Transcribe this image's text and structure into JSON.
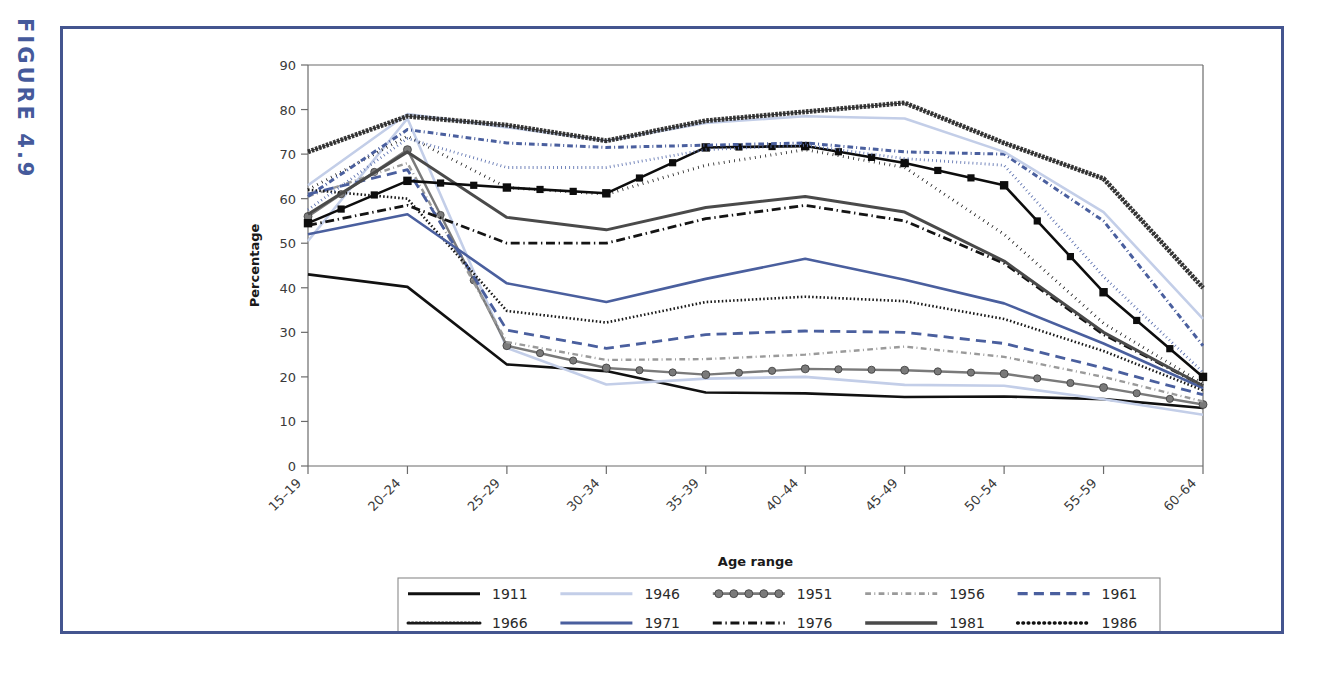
{
  "figure": {
    "label": "FIGURE 4.9",
    "label_color": "#455a9b",
    "frame_color": "#44558f"
  },
  "chart_data": {
    "type": "line",
    "title": "",
    "xlabel": "Age range",
    "ylabel": "Percentage",
    "ylim": [
      0,
      90
    ],
    "yticks": [
      0,
      10,
      20,
      30,
      40,
      50,
      60,
      70,
      80,
      90
    ],
    "grid": false,
    "legend_position": "bottom",
    "legend_columns": 5,
    "categories": [
      "15–19",
      "20–24",
      "25–29",
      "30–34",
      "35–39",
      "40–44",
      "45–49",
      "50–54",
      "55–59",
      "60–64"
    ],
    "series": [
      {
        "name": "1911",
        "color": "#111111",
        "width": 2.6,
        "dash": "none",
        "marker": "none",
        "values": [
          43.0,
          40.2,
          22.8,
          21.3,
          16.5,
          16.3,
          15.5,
          15.6,
          15.0,
          13.0
        ]
      },
      {
        "name": "1946",
        "color": "#c3cee8",
        "width": 2.6,
        "dash": "none",
        "marker": "none",
        "values": [
          50.5,
          78.0,
          26.5,
          18.3,
          19.6,
          20.0,
          18.2,
          18.0,
          15.0,
          11.5
        ]
      },
      {
        "name": "1951",
        "color": "#7a7a7a",
        "width": 2.4,
        "dash": "none",
        "marker": "circle",
        "values": [
          56.0,
          71.0,
          27.0,
          22.0,
          20.5,
          21.8,
          21.5,
          20.7,
          17.6,
          13.8
        ]
      },
      {
        "name": "1956",
        "color": "#9a9a9a",
        "width": 2.4,
        "dash": "dashdot",
        "marker": "none",
        "values": [
          60.5,
          68.0,
          27.8,
          23.8,
          24.0,
          25.0,
          26.8,
          24.5,
          20.0,
          14.5
        ]
      },
      {
        "name": "1961",
        "color": "#4a5f9e",
        "width": 2.8,
        "dash": "dashed",
        "marker": "none",
        "values": [
          61.0,
          66.5,
          30.5,
          26.4,
          29.5,
          30.3,
          30.0,
          27.5,
          22.0,
          16.0
        ]
      },
      {
        "name": "1966",
        "color": "#1a1a1a",
        "width": 2.6,
        "dash": "dotted-sq",
        "marker": "none",
        "values": [
          62.0,
          60.0,
          34.8,
          32.2,
          36.8,
          38.0,
          37.0,
          33.0,
          25.8,
          17.0
        ]
      },
      {
        "name": "1971",
        "color": "#4a5f9e",
        "width": 2.6,
        "dash": "none",
        "marker": "none",
        "values": [
          52.0,
          56.5,
          41.0,
          36.8,
          42.0,
          46.5,
          41.8,
          36.5,
          27.5,
          17.5
        ]
      },
      {
        "name": "1976",
        "color": "#141414",
        "width": 2.8,
        "dash": "dashdot-long",
        "marker": "none",
        "values": [
          54.0,
          58.5,
          50.0,
          50.0,
          55.5,
          58.5,
          55.0,
          45.5,
          29.5,
          18.0
        ]
      },
      {
        "name": "1981",
        "color": "#4a4a4a",
        "width": 3.0,
        "dash": "none",
        "marker": "none",
        "values": [
          56.5,
          70.5,
          55.8,
          53.0,
          58.0,
          60.5,
          57.0,
          46.0,
          30.0,
          18.0
        ]
      },
      {
        "name": "1986",
        "color": "#111111",
        "width": 3.0,
        "dash": "dotted",
        "marker": "none",
        "values": [
          62.0,
          74.0,
          62.5,
          61.0,
          67.5,
          71.0,
          67.0,
          52.0,
          32.0,
          18.5
        ]
      },
      {
        "name": "1991",
        "color": "#0d0d0d",
        "width": 2.6,
        "dash": "none",
        "marker": "square",
        "values": [
          54.5,
          64.0,
          62.5,
          61.2,
          71.5,
          71.8,
          68.0,
          63.0,
          39.0,
          20.0
        ]
      },
      {
        "name": "1996",
        "color": "#5a6fae",
        "width": 2.8,
        "dash": "dotted-fine",
        "marker": "none",
        "values": [
          57.5,
          73.5,
          67.0,
          67.0,
          71.0,
          72.0,
          69.0,
          67.5,
          42.5,
          21.0
        ]
      },
      {
        "name": "2001",
        "color": "#4a5f9e",
        "width": 3.0,
        "dash": "dashdot-dot",
        "marker": "none",
        "values": [
          60.5,
          75.5,
          72.5,
          71.5,
          72.0,
          72.5,
          70.5,
          70.0,
          55.0,
          27.0
        ]
      },
      {
        "name": "2006",
        "color": "#c3cee8",
        "width": 2.6,
        "dash": "none",
        "marker": "none",
        "values": [
          63.0,
          79.0,
          76.0,
          73.0,
          77.0,
          78.5,
          78.0,
          70.5,
          57.0,
          33.0
        ]
      },
      {
        "name": "2009",
        "color": "#2b2b2b",
        "width": 2.2,
        "dash": "hatch",
        "marker": "none",
        "values": [
          70.5,
          78.5,
          76.5,
          73.0,
          77.5,
          79.5,
          81.5,
          72.5,
          64.5,
          40.0
        ]
      }
    ]
  }
}
